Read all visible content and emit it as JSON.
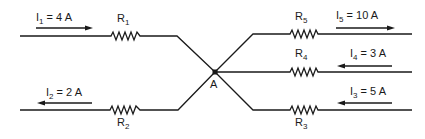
{
  "diagram": {
    "junction": {
      "label": "A"
    },
    "branches": [
      {
        "id": "b1",
        "current_symbol": "I",
        "current_sub": "1",
        "current_value": "= 4 A",
        "resistor_symbol": "R",
        "resistor_sub": "1",
        "direction": "into-junction"
      },
      {
        "id": "b2",
        "current_symbol": "I",
        "current_sub": "2",
        "current_value": "= 2 A",
        "resistor_symbol": "R",
        "resistor_sub": "2",
        "direction": "out-of-junction"
      },
      {
        "id": "b3",
        "current_symbol": "I",
        "current_sub": "3",
        "current_value": "= 5 A",
        "resistor_symbol": "R",
        "resistor_sub": "3",
        "direction": "into-junction"
      },
      {
        "id": "b4",
        "current_symbol": "I",
        "current_sub": "4",
        "current_value": "= 3 A",
        "resistor_symbol": "R",
        "resistor_sub": "4",
        "direction": "into-junction"
      },
      {
        "id": "b5",
        "current_symbol": "I",
        "current_sub": "5",
        "current_value": "= 10 A",
        "resistor_symbol": "R",
        "resistor_sub": "5",
        "direction": "out-of-junction"
      }
    ],
    "colors": {
      "wire": "#1a1a1a",
      "background": "#ffffff"
    }
  }
}
